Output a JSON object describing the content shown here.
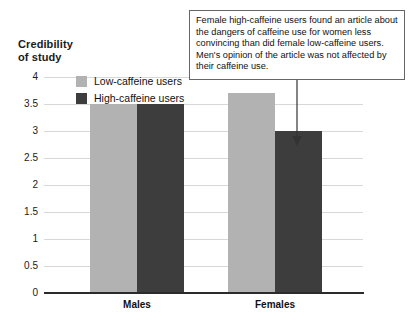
{
  "chart_data": {
    "type": "bar",
    "title": "Credibility\nof study",
    "xlabel": "",
    "ylabel": "Credibility of study",
    "categories": [
      "Males",
      "Females"
    ],
    "series": [
      {
        "name": "Low-caffeine users",
        "color": "#b2b2b2",
        "values": [
          3.5,
          3.7
        ]
      },
      {
        "name": "High-caffeine users",
        "color": "#3d3d3d",
        "values": [
          3.5,
          3.0
        ]
      }
    ],
    "ylim": [
      0,
      4
    ],
    "yticks": [
      "0",
      "0.5",
      "1",
      "1.5",
      "2",
      "2.5",
      "3",
      "3.5",
      "4"
    ],
    "ytick_values": [
      0,
      0.5,
      1,
      1.5,
      2,
      2.5,
      3,
      3.5,
      4
    ],
    "grid": true,
    "legend_position": "top-left-inside",
    "annotations": [
      {
        "text": "Female high-caffeine users found an article about the dangers of caffeine use for women less convincing than did female low-caffeine users. Men's opinion of the article was not affected by their caffeine use.",
        "points_to_series": "High-caffeine users",
        "points_to_category": "Females",
        "points_to_value": 3.0
      }
    ]
  },
  "chart": {
    "title": "Credibility\nof study",
    "legend": [
      {
        "label": "Low-caffeine users",
        "swatch": "low"
      },
      {
        "label": "High-caffeine users",
        "swatch": "high"
      }
    ],
    "yticks": [
      {
        "label": "4",
        "value": 4
      },
      {
        "label": "3.5",
        "value": 3.5
      },
      {
        "label": "3",
        "value": 3
      },
      {
        "label": "2.5",
        "value": 2.5
      },
      {
        "label": "2",
        "value": 2
      },
      {
        "label": "1.5",
        "value": 1.5
      },
      {
        "label": "1",
        "value": 1
      },
      {
        "label": "0.5",
        "value": 0.5
      },
      {
        "label": "0",
        "value": 0
      }
    ],
    "categories": [
      {
        "label": "Males",
        "low": 3.5,
        "high": 3.5
      },
      {
        "label": "Females",
        "low": 3.7,
        "high": 3.0
      }
    ],
    "annotation": "Female high-caffeine users found an article about the dangers of caffeine use for women less convincing than did female low-caffeine users. Men's opinion of the article was not affected by their caffeine use."
  }
}
